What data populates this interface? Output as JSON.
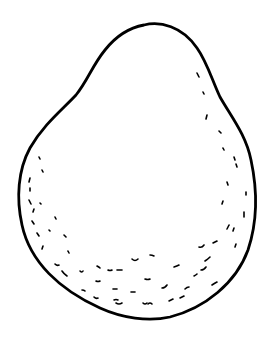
{
  "figure": {
    "label": "",
    "colors": {
      "background": "#ffffff",
      "ink": "#000000"
    }
  }
}
